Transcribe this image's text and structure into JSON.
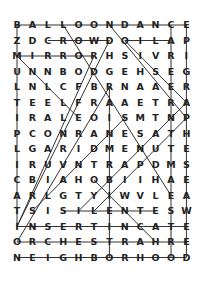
{
  "puzzle": {
    "type": "word-search",
    "rows": [
      "BALLOONDANCE",
      "ZDCROWDOILAP",
      "MIRRORHSIVRI",
      "UNNBODGEHSEG",
      "LNLCFBRNAAER",
      "TEELFRAAETRA",
      "IRALEOISMTNP",
      "PCONRANESATH",
      "LGARIDMENUTE",
      "IRUVNTRAPDMS",
      "CBIAHOBIIHAE",
      "ARLGTYIWVLEA",
      "TSISILENTESW",
      "INSERTINCATE",
      "ORCHESTRAHRE",
      "NEIGHBORHOOD"
    ],
    "found_lines": [
      {
        "r1": 0,
        "c1": 0,
        "r2": 0,
        "c2": 11
      },
      {
        "r1": 1,
        "c1": 2,
        "r2": 1,
        "c2": 6
      },
      {
        "r1": 1,
        "c1": 7,
        "r2": 1,
        "c2": 10
      },
      {
        "r1": 2,
        "c1": 0,
        "r2": 2,
        "c2": 5
      },
      {
        "r1": 12,
        "c1": 3,
        "r2": 12,
        "c2": 9
      },
      {
        "r1": 13,
        "c1": 0,
        "r2": 13,
        "c2": 11
      },
      {
        "r1": 14,
        "c1": 0,
        "r2": 14,
        "c2": 11
      },
      {
        "r1": 15,
        "c1": 0,
        "r2": 15,
        "c2": 11
      },
      {
        "r1": 0,
        "c1": 0,
        "r2": 13,
        "c2": 0
      },
      {
        "r1": 0,
        "c1": 10,
        "r2": 15,
        "c2": 10
      },
      {
        "r1": 0,
        "c1": 11,
        "r2": 15,
        "c2": 11
      },
      {
        "r1": 4,
        "c1": 6,
        "r2": 15,
        "c2": 6
      },
      {
        "r1": 0,
        "c1": 3,
        "r2": 11,
        "c2": 10
      },
      {
        "r1": 0,
        "c1": 6,
        "r2": 6,
        "c2": 11
      },
      {
        "r1": 1,
        "c1": 7,
        "r2": 5,
        "c2": 11
      },
      {
        "r1": 2,
        "c1": 0,
        "r2": 6,
        "c2": 4
      },
      {
        "r1": 1,
        "c1": 6,
        "r2": 13,
        "c2": 0
      },
      {
        "r1": 2,
        "c1": 5,
        "r2": 13,
        "c2": 0
      },
      {
        "r1": 4,
        "c1": 6,
        "r2": 14,
        "c2": 0
      },
      {
        "r1": 5,
        "c1": 11,
        "r2": 12,
        "c2": 4
      },
      {
        "r1": 6,
        "c1": 11,
        "r2": 12,
        "c2": 5
      },
      {
        "r1": 6,
        "c1": 7,
        "r2": 12,
        "c2": 1
      },
      {
        "r1": 10,
        "c1": 5,
        "r2": 14,
        "c2": 9
      }
    ]
  }
}
